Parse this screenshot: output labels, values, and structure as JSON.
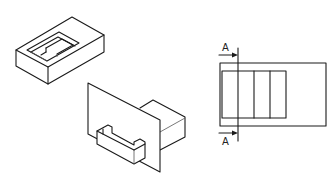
{
  "figure": {
    "views": [
      {
        "id": "isometric-box-with-recess",
        "type": "isometric"
      },
      {
        "id": "isometric-plate-with-blocks",
        "type": "isometric"
      },
      {
        "id": "top-view-section",
        "type": "orthographic"
      }
    ],
    "section_marker": {
      "top_label": "A",
      "bottom_label": "A"
    },
    "colors": {
      "line": "#1a1a1a",
      "background": "#ffffff"
    }
  }
}
